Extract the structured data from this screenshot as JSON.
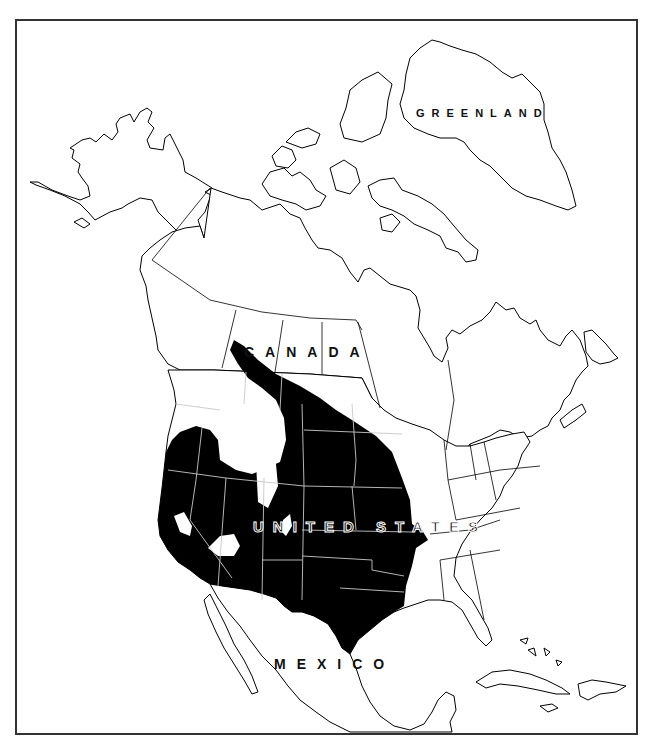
{
  "map": {
    "type": "species range map",
    "region": "North America",
    "labels": {
      "greenland": "GREENLAND",
      "canada": "CANADA",
      "united_states": "UNITED STATES",
      "mexico": "MEXICO"
    },
    "colors": {
      "range_fill": "#000000",
      "land_fill": "#ffffff",
      "outline": "#000000",
      "internal_borders_in_range": "#c8c8c8",
      "frame": "#333333"
    },
    "range_description": "Shaded range covers western and central United States from the Pacific coast east to the Mississippi River, south through Texas, and north into the Canadian prairies (Alberta, Saskatchewan, Manitoba); small unshaded gaps in the Great Basin and northern Rockies."
  }
}
